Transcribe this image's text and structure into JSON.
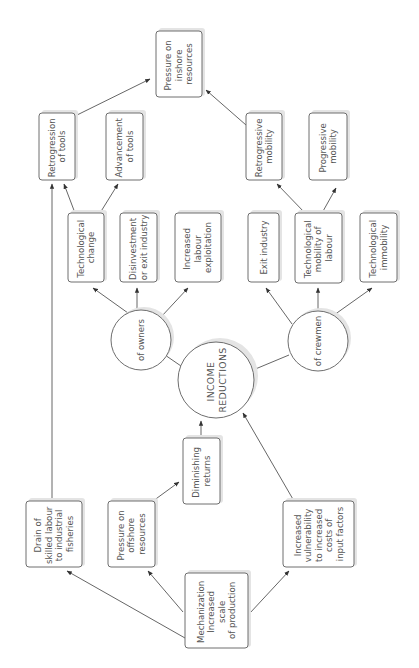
{
  "diagram": {
    "orientation": "rotated -90deg (text reads bottom-to-top)",
    "center": {
      "id": "income",
      "lines": [
        "INCOME",
        "REDUCTIONS"
      ]
    },
    "nodes": {
      "pressure_inshore": {
        "lines": [
          "Pressure on",
          "inshore",
          "resources"
        ]
      },
      "retro_tools": {
        "lines": [
          "Retrogression",
          "of tools"
        ]
      },
      "adv_tools": {
        "lines": [
          "Advancement",
          "of tools"
        ]
      },
      "retro_mobility": {
        "lines": [
          "Retrogressive",
          "mobility"
        ]
      },
      "prog_mobility": {
        "lines": [
          "Progressive",
          "mobility"
        ]
      },
      "tech_change": {
        "lines": [
          "Technological",
          "change"
        ]
      },
      "disinvest": {
        "lines": [
          "Disinvestment",
          "or exit industry"
        ]
      },
      "labour_exploit": {
        "lines": [
          "Increased",
          "labour",
          "exploitation"
        ]
      },
      "exit_industry": {
        "lines": [
          "Exit industry"
        ]
      },
      "tech_mobility": {
        "lines": [
          "Technological",
          "mobility of",
          "labour"
        ]
      },
      "tech_immobility": {
        "lines": [
          "Technological",
          "immobility"
        ]
      },
      "owners": {
        "lines": [
          "of owners"
        ]
      },
      "crewmen": {
        "lines": [
          "of crewmen"
        ]
      },
      "drain": {
        "lines": [
          "Drain of",
          "skilled labour",
          "to industrial",
          "fisheries"
        ]
      },
      "pressure_offshore": {
        "lines": [
          "Pressure on",
          "offshore",
          "resources"
        ]
      },
      "diminishing": {
        "lines": [
          "Diminishing",
          "returns"
        ]
      },
      "mechanization": {
        "lines": [
          "Mechanization",
          "Increased",
          "scale",
          "of production"
        ]
      },
      "vulnerability": {
        "lines": [
          "Increased",
          "vulnerability",
          "to increased",
          "costs of",
          "input factors"
        ]
      }
    },
    "edges": [
      [
        "mechanization",
        "drain"
      ],
      [
        "mechanization",
        "pressure_offshore"
      ],
      [
        "mechanization",
        "vulnerability"
      ],
      [
        "pressure_offshore",
        "diminishing"
      ],
      [
        "diminishing",
        "income"
      ],
      [
        "vulnerability",
        "income"
      ],
      [
        "drain",
        "retro_tools"
      ],
      [
        "income",
        "owners"
      ],
      [
        "income",
        "crewmen"
      ],
      [
        "owners",
        "tech_change"
      ],
      [
        "owners",
        "disinvest"
      ],
      [
        "owners",
        "labour_exploit"
      ],
      [
        "crewmen",
        "exit_industry"
      ],
      [
        "crewmen",
        "tech_mobility"
      ],
      [
        "crewmen",
        "tech_immobility"
      ],
      [
        "tech_change",
        "retro_tools"
      ],
      [
        "tech_change",
        "adv_tools"
      ],
      [
        "tech_mobility",
        "retro_mobility"
      ],
      [
        "tech_mobility",
        "prog_mobility"
      ],
      [
        "retro_tools",
        "pressure_inshore"
      ],
      [
        "retro_mobility",
        "pressure_inshore"
      ]
    ]
  }
}
